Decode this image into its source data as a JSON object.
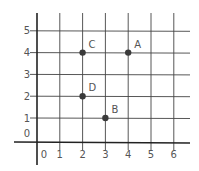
{
  "chart_data": {
    "type": "scatter",
    "title": "",
    "xlabel": "",
    "ylabel": "",
    "x_ticks": [
      "0",
      "1",
      "2",
      "3",
      "4",
      "5",
      "6"
    ],
    "y_ticks": [
      "0",
      "1",
      "2",
      "3",
      "4",
      "5"
    ],
    "xlim": [
      0,
      6.5
    ],
    "ylim": [
      -0.5,
      5.5
    ],
    "grid": true,
    "points": [
      {
        "label": "A",
        "x": 4,
        "y": 4
      },
      {
        "label": "B",
        "x": 3,
        "y": 1
      },
      {
        "label": "C",
        "x": 2,
        "y": 4
      },
      {
        "label": "D",
        "x": 2,
        "y": 2
      }
    ]
  },
  "colors": {
    "point": "#3a3a3a",
    "grid": "#444444",
    "label": "#555555"
  }
}
